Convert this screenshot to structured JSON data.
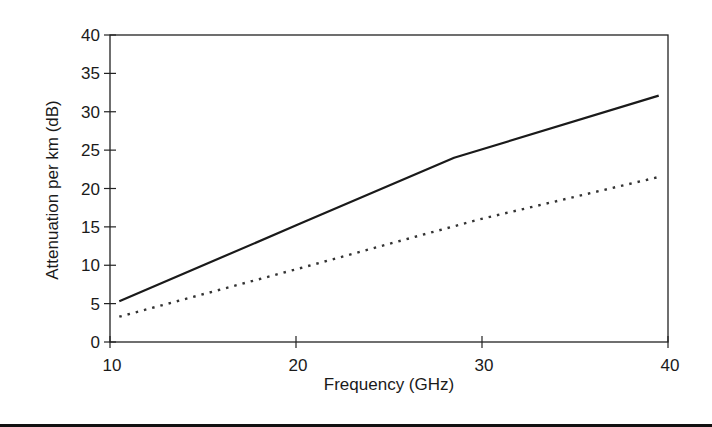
{
  "chart_data": {
    "type": "line",
    "title": "",
    "xlabel": "Frequency (GHz)",
    "ylabel": "Attenuation per km (dB)",
    "xlim": [
      10,
      40
    ],
    "ylim": [
      0,
      40
    ],
    "x_ticks": [
      10,
      20,
      30,
      40
    ],
    "y_ticks": [
      0,
      5,
      10,
      15,
      20,
      25,
      30,
      35,
      40
    ],
    "grid": false,
    "legend": null,
    "series": [
      {
        "name": "solid",
        "style": "solid",
        "color": "#1a1a1a",
        "x": [
          10.5,
          20.2,
          28.5,
          39.5
        ],
        "y": [
          5.3,
          15.4,
          24.0,
          32.1
        ]
      },
      {
        "name": "dotted",
        "style": "dotted",
        "color": "#333333",
        "x": [
          10.5,
          20.2,
          26.7,
          29.9,
          39.5
        ],
        "y": [
          3.3,
          9.6,
          13.9,
          16.0,
          21.5
        ]
      }
    ]
  },
  "layout": {
    "plot_left": 110,
    "plot_right": 668,
    "plot_top": 35,
    "plot_bottom": 342
  }
}
